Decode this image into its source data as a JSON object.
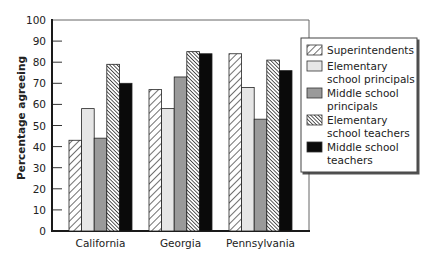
{
  "chart_data": {
    "type": "bar",
    "title": "",
    "xlabel": "",
    "ylabel": "Percentage agreeing",
    "ylim": [
      0,
      100
    ],
    "yticks": [
      0,
      10,
      20,
      30,
      40,
      50,
      60,
      70,
      80,
      90,
      100
    ],
    "categories": [
      "California",
      "Georgia",
      "Pennsylvania"
    ],
    "series": [
      {
        "name": "Superintendents",
        "pattern": "diagonal-hatch-light",
        "values": [
          43,
          67,
          84
        ]
      },
      {
        "name": "Elementary school principals",
        "pattern": "light-gray",
        "values": [
          58,
          58,
          68
        ]
      },
      {
        "name": "Middle school principals",
        "pattern": "medium-gray",
        "values": [
          44,
          73,
          53
        ]
      },
      {
        "name": "Elementary school teachers",
        "pattern": "diagonal-hatch-dense",
        "values": [
          79,
          85,
          81
        ]
      },
      {
        "name": "Middle school teachers",
        "pattern": "black",
        "values": [
          70,
          84,
          76
        ]
      }
    ],
    "legend": {
      "position": "right",
      "entries": [
        [
          "Superintendents"
        ],
        [
          "Elementary",
          "school principals"
        ],
        [
          "Middle school",
          "principals"
        ],
        [
          "Elementary",
          "school teachers"
        ],
        [
          "Middle school",
          "teachers"
        ]
      ]
    },
    "grid": false
  },
  "colors": {
    "axis": "#1a1a1a",
    "light_gray": "#e6e6e6",
    "medium_gray": "#9a9a9a",
    "black": "#0a0a0a",
    "hatch": "#333333"
  }
}
